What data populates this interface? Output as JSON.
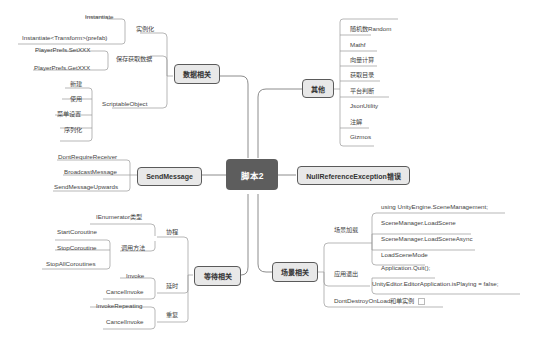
{
  "central": {
    "label": "脚本2"
  },
  "topics": {
    "data": {
      "label": "数据相关",
      "groups": [
        {
          "label": "实例化",
          "items": [
            "Instantiate",
            "Instantiate<Transform>(prefab)"
          ]
        },
        {
          "label": "保存获取数据",
          "items": [
            "PlayerPrefs.SetXXX",
            "PlayerPrefs.GetXXX"
          ]
        },
        {
          "label": "ScriptableObject",
          "items": [
            "新建",
            "使用",
            "菜单设置",
            "序列化"
          ]
        }
      ]
    },
    "sendmessage": {
      "label": "SendMessage",
      "items": [
        "DontRequireReceiver",
        "BroadcastMessage",
        "SendMessageUpwards"
      ]
    },
    "wait": {
      "label": "等待相关",
      "groups": [
        {
          "label": "协程",
          "items": [
            "IEnumerator类型"
          ],
          "subgroup": {
            "label": "调用方法",
            "items": [
              "StartCoroutine",
              "StopCoroutine",
              "StopAllCoroutines"
            ]
          }
        },
        {
          "label": "延时",
          "items": [
            "Invoke",
            "CancelInvoke"
          ]
        },
        {
          "label": "重复",
          "items": [
            "InvokeRepeating",
            "CancelInvoke"
          ]
        }
      ]
    },
    "other": {
      "label": "其他",
      "items": [
        "随机数Random",
        "Mathf",
        "向量计算",
        "获取目录",
        "平台判断",
        "JsonUtility",
        "注解",
        "Gizmos"
      ]
    },
    "nullref": {
      "label": "NullReferenceException错误"
    },
    "scene": {
      "label": "场景相关",
      "groups": [
        {
          "label": "场景加载",
          "items": [
            "using UnityEngine.SceneManagement;",
            "SceneManager.LoadScene",
            "SceneManager.LoadSceneAsync",
            "LoadSceneMode"
          ]
        },
        {
          "label": "应用退出",
          "items": [
            "Application.Quit();",
            "UnityEditor.EditorApplication.isPlaying = false;"
          ]
        },
        {
          "label": "DontDestroyOnLoad和单实例",
          "note_icon": "note-icon"
        }
      ]
    }
  }
}
